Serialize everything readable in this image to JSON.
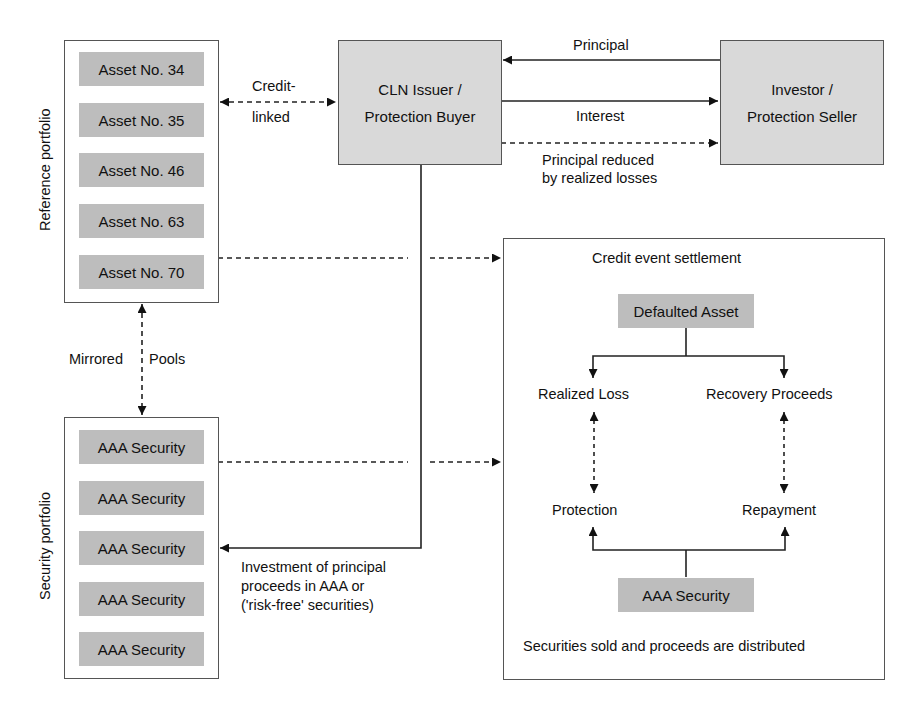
{
  "reference_portfolio": {
    "title": "Reference portfolio",
    "assets": [
      "Asset No. 34",
      "Asset No. 35",
      "Asset No. 46",
      "Asset No. 63",
      "Asset No. 70"
    ]
  },
  "security_portfolio": {
    "title": "Security portfolio",
    "securities": [
      "AAA Security",
      "AAA Security",
      "AAA Security",
      "AAA Security",
      "AAA Security"
    ]
  },
  "mirrored_pools": {
    "left": "Mirrored",
    "right": "Pools"
  },
  "credit_linked": {
    "line1": "Credit-",
    "line2": "linked"
  },
  "cln_issuer": {
    "line1": "CLN Issuer /",
    "line2": "Protection Buyer"
  },
  "investor": {
    "line1": "Investor /",
    "line2": "Protection Seller"
  },
  "flows": {
    "principal": "Principal",
    "interest": "Interest",
    "principal_reduced": {
      "line1": "Principal reduced",
      "line2": "by realized losses"
    },
    "investment": {
      "line1": "Investment of principal",
      "line2": "proceeds in AAA or",
      "line3": "('risk-free' securities)"
    }
  },
  "settlement": {
    "title": "Credit event settlement",
    "defaulted_asset": "Defaulted Asset",
    "realized_loss": "Realized Loss",
    "recovery_proceeds": "Recovery Proceeds",
    "protection": "Protection",
    "repayment": "Repayment",
    "aaa_security": "AAA Security",
    "footer": "Securities sold and proceeds are distributed"
  },
  "colors": {
    "entity_fill": "#d9d9d9",
    "pill_fill": "#bdbdbd",
    "line": "#222222",
    "border": "#555555"
  }
}
